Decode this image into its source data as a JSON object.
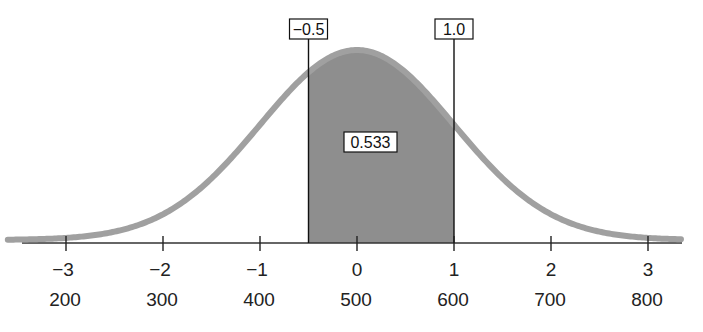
{
  "chart_data": {
    "type": "area",
    "title": "",
    "distribution": {
      "mean": 500,
      "sd": 100
    },
    "z_ticks": [
      -3,
      -2,
      -1,
      0,
      1,
      2,
      3
    ],
    "z_tick_labels": [
      "−3",
      "−2",
      "−1",
      "0",
      "1",
      "2",
      "3"
    ],
    "x_tick_labels": [
      "200",
      "300",
      "400",
      "500",
      "600",
      "700",
      "800"
    ],
    "shaded_region": {
      "z_low": -0.5,
      "z_high": 1.0,
      "area": 0.533
    },
    "annotations": [
      {
        "text": "−0.5",
        "z": -0.5
      },
      {
        "text": "1.0",
        "z": 1.0
      },
      {
        "text": "0.533",
        "position": "inside-shaded-region"
      }
    ],
    "xlabel": "",
    "ylabel": "",
    "xlim": [
      -3.5,
      3.5
    ],
    "grid": false,
    "colors": {
      "curve": "#9a9a9a",
      "shade": "#8c8c8c",
      "axis": "#333333"
    }
  },
  "labels": {
    "left_bound": "−0.5",
    "right_bound": "1.0",
    "area": "0.533"
  }
}
